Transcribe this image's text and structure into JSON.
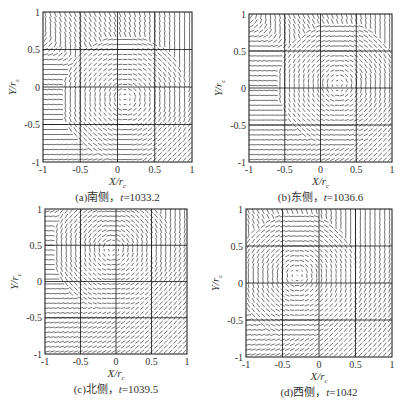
{
  "figure": {
    "panels": [
      {
        "id": "a",
        "caption_prefix": "(a)南侧，",
        "caption_var": "t",
        "caption_value": "=1033.2",
        "box": {
          "left": 43,
          "top": 12,
          "right": 192,
          "bottom": 162
        },
        "vortex_center": [
          0.1,
          -0.15
        ]
      },
      {
        "id": "b",
        "caption_prefix": "(b)东侧，",
        "caption_var": "t",
        "caption_value": "=1036.6",
        "box": {
          "left": 249,
          "top": 14,
          "right": 392,
          "bottom": 162
        },
        "vortex_center": [
          0.25,
          0.05
        ]
      },
      {
        "id": "c",
        "caption_prefix": "(c)北侧，",
        "caption_var": "t",
        "caption_value": "=1039.5",
        "box": {
          "left": 45,
          "top": 209,
          "right": 187,
          "bottom": 354
        },
        "vortex_center": [
          -0.05,
          0.45
        ]
      },
      {
        "id": "d",
        "caption_prefix": "(d)西侧，",
        "caption_var": "t",
        "caption_value": "=1042",
        "box": {
          "left": 246,
          "top": 209,
          "right": 392,
          "bottom": 357
        },
        "vortex_center": [
          -0.3,
          0.1
        ]
      }
    ]
  },
  "chart_data": [
    {
      "type": "quiver",
      "title": "(a)南侧，t=1033.2",
      "xlabel": "X/r_c",
      "ylabel": "Y/r_c",
      "xlim": [
        -1,
        1
      ],
      "ylim": [
        -1,
        1
      ],
      "xticks": [
        "-1",
        "-0.5",
        "0",
        "0.5",
        "1"
      ],
      "yticks": [
        "-1",
        "-0.5",
        "0",
        "0.5",
        "1"
      ],
      "grid": true,
      "inner_box": [
        -0.5,
        -0.5,
        0.5,
        0.5
      ],
      "vortex_center": [
        0.1,
        -0.15
      ]
    },
    {
      "type": "quiver",
      "title": "(b)东侧，t=1036.6",
      "xlabel": "X/r_c",
      "ylabel": "Y/r_c",
      "xlim": [
        -1,
        1
      ],
      "ylim": [
        -1,
        1
      ],
      "xticks": [
        "-1",
        "-0.5",
        "0",
        "0.5",
        "1"
      ],
      "yticks": [
        "-1",
        "-0.5",
        "0",
        "0.5",
        "1"
      ],
      "grid": true,
      "inner_box": [
        -0.5,
        -0.5,
        0.5,
        0.5
      ],
      "vortex_center": [
        0.25,
        0.05
      ]
    },
    {
      "type": "quiver",
      "title": "(c)北侧，t=1039.5",
      "xlabel": "X/r_c",
      "ylabel": "Y/r_c",
      "xlim": [
        -1,
        1
      ],
      "ylim": [
        -1,
        1
      ],
      "xticks": [
        "-1",
        "-0.5",
        "0",
        "0.5",
        "1"
      ],
      "yticks": [
        "-1",
        "-0.5",
        "0",
        "0.5",
        "1"
      ],
      "grid": true,
      "inner_box": [
        -0.5,
        -0.5,
        0.5,
        0.5
      ],
      "vortex_center": [
        -0.05,
        0.45
      ]
    },
    {
      "type": "quiver",
      "title": "(d)西侧，t=1042",
      "xlabel": "X/r_c",
      "ylabel": "Y/r_c",
      "xlim": [
        -1,
        1
      ],
      "ylim": [
        -1,
        1
      ],
      "xticks": [
        "-1",
        "-0.5",
        "0",
        "0.5",
        "1"
      ],
      "yticks": [
        "-1",
        "-0.5",
        "0",
        "0.5",
        "1"
      ],
      "grid": true,
      "inner_box": [
        -0.5,
        -0.5,
        0.5,
        0.5
      ],
      "vortex_center": [
        -0.3,
        0.1
      ]
    }
  ],
  "axes": {
    "xlabel_main": "X/r",
    "xlabel_sub": "c",
    "ylabel_main": "Y/r",
    "ylabel_sub": "c",
    "ticks": [
      "-1",
      "-0.5",
      "0",
      "0.5",
      "1"
    ]
  }
}
